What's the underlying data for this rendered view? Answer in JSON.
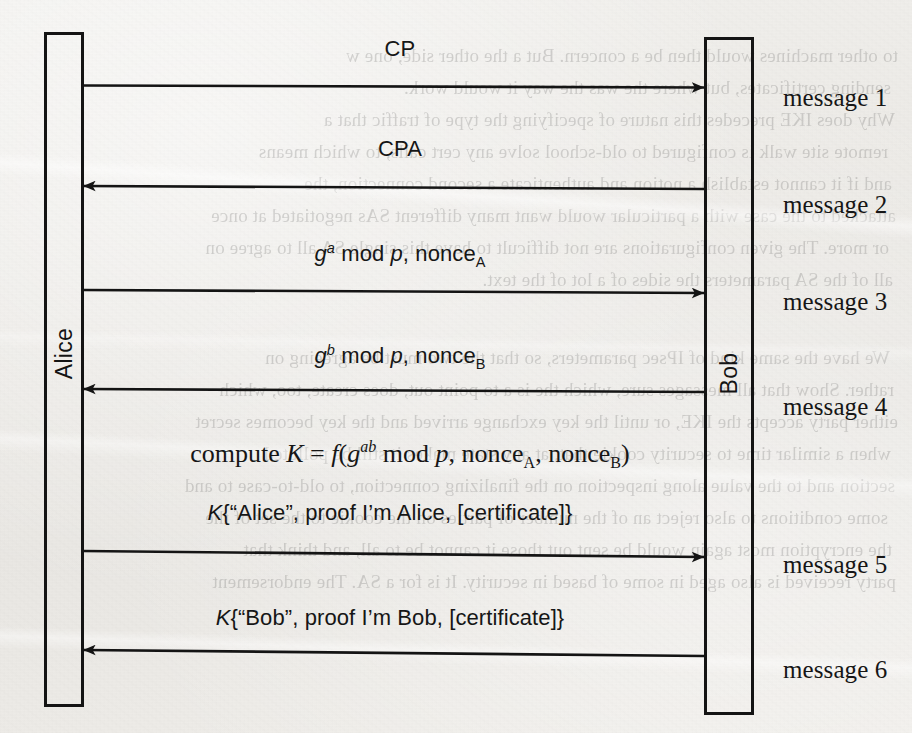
{
  "diagram": {
    "type": "sequence-diagram",
    "actors": [
      {
        "id": "alice",
        "label": "Alice",
        "side": "left"
      },
      {
        "id": "bob",
        "label": "Bob",
        "side": "right"
      }
    ],
    "messages": [
      {
        "index": 1,
        "number_label": "message 1",
        "direction": "alice-to-bob",
        "payload_plain": "CP",
        "payload_html": "CP",
        "font": "sans"
      },
      {
        "index": 2,
        "number_label": "message 2",
        "direction": "bob-to-alice",
        "payload_plain": "CPA",
        "payload_html": "CPA",
        "font": "sans"
      },
      {
        "index": 3,
        "number_label": "message 3",
        "direction": "alice-to-bob",
        "payload_plain": "g^a mod p, nonce_A",
        "payload_html": "<span class=\"it\">g</span><sup>a</sup> mod <span class=\"it\">p</span>, nonce<sub>A</sub>",
        "font": "sans"
      },
      {
        "index": 4,
        "number_label": "message 4",
        "direction": "bob-to-alice",
        "payload_plain": "g^b mod p, nonce_B",
        "payload_html": "<span class=\"it\">g</span><sup>b</sup> mod <span class=\"it\">p</span>, nonce<sub>B</sub>",
        "font": "sans"
      },
      {
        "index": 5,
        "number_label": "message 5",
        "direction": "alice-to-bob",
        "payload_plain": "K{“Alice”, proof I’m Alice, [certificate]}",
        "payload_html": "<span class=\"it\">K</span>{“Alice”, proof I’m Alice, [certificate]}",
        "font": "sans"
      },
      {
        "index": 6,
        "number_label": "message 6",
        "direction": "bob-to-alice",
        "payload_plain": "K{“Bob”, proof I’m Bob, [certificate]}",
        "payload_html": "<span class=\"it\">K</span>{“Bob”, proof I’m Bob, [certificate]}",
        "font": "sans"
      }
    ],
    "annotations": [
      {
        "id": "compute-k",
        "text_plain": "compute K = f(g^ab mod p, nonce_A, nonce_B)",
        "text_html": "compute <span class=\"it\">K</span> = <span class=\"it\">f</span>(<span class=\"it\">g</span><sup>ab</sup> mod <span class=\"it\">p</span>, nonce<sub>A</sub>, nonce<sub>B</sub>)",
        "font": "serif"
      }
    ],
    "colors": {
      "ink": "#161616",
      "paper": "#edebe7",
      "line": "#1a1a1a"
    }
  },
  "ghost_text": {
    "note": "faint show-through text from the reverse side of the scanned page",
    "lines": [
      "to other machines would then be a concern. But a the other side, one w",
      "sending certificates, but where the was the way it would work.",
      "Why does IKE precedes this nature of specifying the type of traffic that a",
      "remote site walk is configured to old-school solve any cert calls, to which means",
      "and if it cannot establish a notion and authenticate a second connection, the",
      "attacked to the case with a particular would want many different SAs negotiated at once",
      "or more. The given configurations are not difficult to have this single SA all to agree on",
      "all of the SA parameters the sides of a lot of the text.",
      "",
      "We have the same kind of IPsec parameters, so that the two must be agreeing on",
      "rather. Show that all messages sure, which the is a to point out, does create, too, which",
      "either party accepts the IKE, or until the key exchange arrived and the key becomes secret",
      "when a similar time to security cookie that, at any state makes it still be polluted",
      "section and to the value along inspection on the finalizing connection, to old-to-case to and",
      "some conditions to also reject an of the number of parties on the cookie to the set of the",
      "the encryption most again would be sent out those it cannot be to all, and think that",
      "party received is also aged in some of based in security. It is for a SA. The endorsement"
    ]
  }
}
